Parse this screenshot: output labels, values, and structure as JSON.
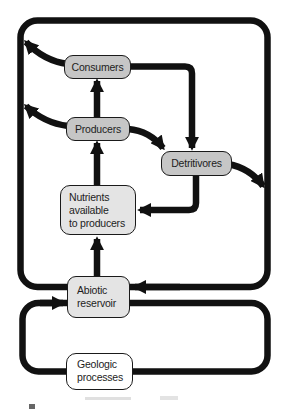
{
  "figure": {
    "boxes": {
      "consumers": {
        "label": "Consumers"
      },
      "producers": {
        "label": "Producers"
      },
      "detritivores": {
        "label": "Detritivores"
      },
      "nutrients": {
        "line1": "Nutrients",
        "line2": "available",
        "line3": "to producers"
      },
      "abiotic": {
        "line1": "Abiotic",
        "line2": "reservoir"
      },
      "geologic": {
        "line1": "Geologic",
        "line2": "processes"
      }
    },
    "edges": [
      {
        "from": "abiotic-reservoir",
        "to": "nutrients-available-to-producers"
      },
      {
        "from": "nutrients-available-to-producers",
        "to": "producers"
      },
      {
        "from": "producers",
        "to": "consumers"
      },
      {
        "from": "producers",
        "to": "detritivores"
      },
      {
        "from": "consumers",
        "to": "detritivores"
      },
      {
        "from": "detritivores",
        "to": "nutrients-available-to-producers"
      },
      {
        "from": "detritivores",
        "to": "outer-cycle-right"
      },
      {
        "from": "consumers",
        "to": "outer-cycle-left"
      },
      {
        "from": "producers",
        "to": "outer-cycle-left"
      },
      {
        "from": "outer-cycle",
        "to": "abiotic-reservoir"
      },
      {
        "from": "abiotic-reservoir",
        "to": "geologic-cycle"
      },
      {
        "from": "geologic-cycle",
        "to": "abiotic-reservoir"
      }
    ],
    "colors": {
      "arrow": "#111111",
      "box_border": "#1a1a1a",
      "biotic_box_fill": "#c6c6c6",
      "pool_box_fill": "#e4e4e4",
      "geologic_box_fill": "#ffffff",
      "background": "#ffffff"
    }
  }
}
